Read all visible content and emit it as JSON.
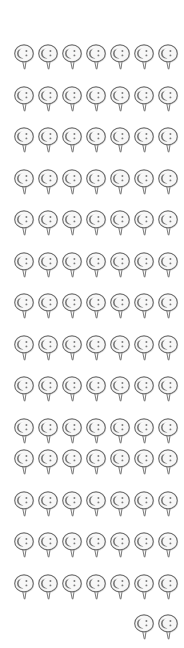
{
  "canvas": {
    "width": 184,
    "height": 648,
    "background": "#ffffff",
    "title": "Balloon Pin Icon Grid"
  },
  "icon": {
    "name": "balloon-pin-face-icon",
    "label": "balloon pin with C face",
    "stroke_color": "#6e6e6e",
    "fill_color": "#f7f7f7",
    "shadow_color": "#9a9a9a",
    "face_color": "#5a5a5a",
    "width": 22,
    "height": 30
  },
  "grid": {
    "columns": 7,
    "full_rows": 13,
    "total_icons": 93,
    "col_pitch": 24,
    "row_pitch": 41.5,
    "origin_x": 13,
    "origin_y": 42,
    "last_row_columns": [
      5,
      6
    ],
    "last_row_count": 2
  },
  "rows": [
    {
      "index": 0,
      "count": 7,
      "start_col": 0,
      "y": 42
    },
    {
      "index": 1,
      "count": 7,
      "start_col": 0,
      "y": 84
    },
    {
      "index": 2,
      "count": 7,
      "start_col": 0,
      "y": 125
    },
    {
      "index": 3,
      "count": 7,
      "start_col": 0,
      "y": 167
    },
    {
      "index": 4,
      "count": 7,
      "start_col": 0,
      "y": 208
    },
    {
      "index": 5,
      "count": 7,
      "start_col": 0,
      "y": 250
    },
    {
      "index": 6,
      "count": 7,
      "start_col": 0,
      "y": 291
    },
    {
      "index": 7,
      "count": 7,
      "start_col": 0,
      "y": 333
    },
    {
      "index": 8,
      "count": 7,
      "start_col": 0,
      "y": 374
    },
    {
      "index": 9,
      "count": 7,
      "start_col": 0,
      "y": 416
    },
    {
      "index": 10,
      "count": 7,
      "start_col": 0,
      "y": 447
    },
    {
      "index": 11,
      "count": 7,
      "start_col": 0,
      "y": 489
    },
    {
      "index": 12,
      "count": 7,
      "start_col": 0,
      "y": 530
    },
    {
      "index": 13,
      "count": 7,
      "start_col": 0,
      "y": 572
    },
    {
      "index": 14,
      "count": 2,
      "start_col": 5,
      "y": 612
    }
  ]
}
